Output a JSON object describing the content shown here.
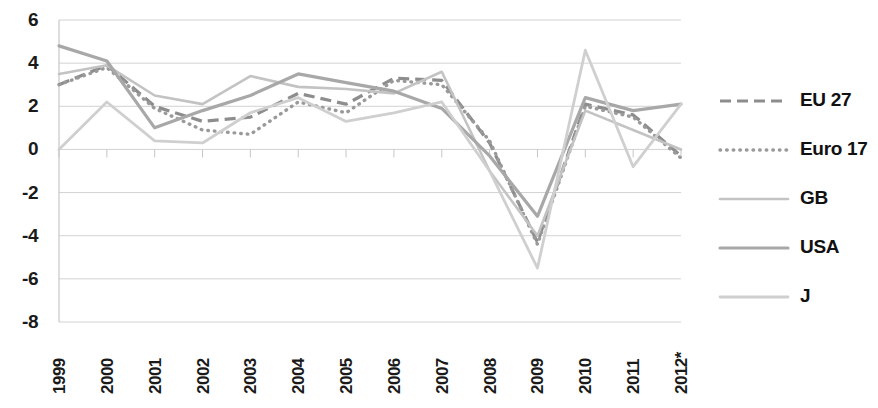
{
  "chart_data": {
    "type": "line",
    "title": "",
    "subtitle": "",
    "xlabel": "",
    "ylabel": "",
    "categories": [
      "1999",
      "2000",
      "2001",
      "2002",
      "2003",
      "2004",
      "2005",
      "2006",
      "2007",
      "2008",
      "2009",
      "2010",
      "2011",
      "2012*"
    ],
    "x_tick_labels": [
      "1999",
      "2000",
      "2001",
      "2002",
      "2003",
      "2004",
      "2005",
      "2006",
      "2007",
      "2008",
      "2009",
      "2010",
      "2011",
      "2012*"
    ],
    "y_tick_labels": [
      "6",
      "4",
      "2",
      "0",
      "-2",
      "-4",
      "-6",
      "-8"
    ],
    "y_ticks": [
      6,
      4,
      2,
      0,
      -2,
      -4,
      -6,
      -8
    ],
    "ylim": [
      -8,
      6
    ],
    "grid": true,
    "grid_axis": "y",
    "legend_position": "right",
    "series": [
      {
        "name": "EU 27",
        "style": "dashed",
        "color": "#8d8d8d",
        "values": [
          3.0,
          3.9,
          2.0,
          1.3,
          1.5,
          2.6,
          2.1,
          3.3,
          3.2,
          0.3,
          -4.3,
          2.1,
          1.6,
          -0.3
        ]
      },
      {
        "name": "Euro 17",
        "style": "dotted",
        "color": "#9a9a9a",
        "values": [
          3.0,
          3.8,
          1.9,
          0.9,
          0.7,
          2.2,
          1.7,
          3.2,
          3.0,
          0.4,
          -4.4,
          2.0,
          1.5,
          -0.4
        ]
      },
      {
        "name": "GB",
        "style": "solid-light",
        "color": "#c3c3c3",
        "values": [
          3.5,
          3.9,
          2.5,
          2.1,
          3.4,
          2.9,
          2.8,
          2.6,
          3.6,
          -1.0,
          -4.0,
          1.8,
          0.9,
          0.0
        ]
      },
      {
        "name": "USA",
        "style": "solid-medium",
        "color": "#a8a8a8",
        "values": [
          4.8,
          4.1,
          1.0,
          1.8,
          2.5,
          3.5,
          3.1,
          2.7,
          1.9,
          -0.3,
          -3.1,
          2.4,
          1.8,
          2.1
        ]
      },
      {
        "name": "J",
        "style": "solid-pale",
        "color": "#cfcfcf",
        "values": [
          0.0,
          2.2,
          0.4,
          0.3,
          1.7,
          2.4,
          1.3,
          1.7,
          2.2,
          -1.0,
          -5.5,
          4.6,
          -0.8,
          2.1
        ]
      }
    ]
  },
  "legend": {
    "items": [
      {
        "label": "EU 27"
      },
      {
        "label": "Euro 17"
      },
      {
        "label": "GB"
      },
      {
        "label": "USA"
      },
      {
        "label": "J"
      }
    ]
  }
}
